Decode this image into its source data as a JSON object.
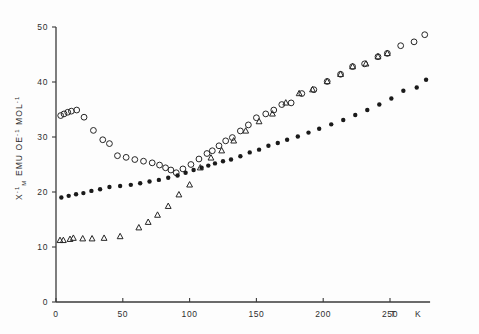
{
  "figure": {
    "background_color": "#fdfdfd",
    "ink_color": "#262626"
  },
  "chart_data": {
    "type": "scatter",
    "title": "",
    "subtitle": "",
    "xlabel": "T",
    "xunit": "K",
    "ylabel": "X-1 M  EMU  OE-1  MOL-1",
    "ylabel_parts": {
      "symbol": "X",
      "symbol_superscript": "-1",
      "symbol_subscript": "M",
      "unit1": "EMU",
      "unit2": "OE",
      "unit2_superscript": "-1",
      "unit3": "MOL",
      "unit3_superscript": "-1"
    },
    "xlim": [
      0,
      280
    ],
    "ylim": [
      0,
      50
    ],
    "xticks": [
      0,
      50,
      100,
      150,
      200,
      250
    ],
    "yticks": [
      0,
      10,
      20,
      30,
      40,
      50
    ],
    "xtick_labels": [
      "0",
      "50",
      "100",
      "150",
      "200",
      "250"
    ],
    "ytick_labels": [
      "0",
      "10",
      "20",
      "30",
      "40",
      "50"
    ],
    "grid": false,
    "legend": false,
    "legend_position": "none",
    "series": [
      {
        "name": "open-circles",
        "marker": "open-circle",
        "color": "#262626",
        "points": [
          [
            3.5,
            33.9
          ],
          [
            6.0,
            34.2
          ],
          [
            8.8,
            34.5
          ],
          [
            11.5,
            34.7
          ],
          [
            15.5,
            34.9
          ],
          [
            21.0,
            33.6
          ],
          [
            28.0,
            31.2
          ],
          [
            35.0,
            29.5
          ],
          [
            40.0,
            28.8
          ],
          [
            46.0,
            26.6
          ],
          [
            52.5,
            26.3
          ],
          [
            59.0,
            25.9
          ],
          [
            65.5,
            25.6
          ],
          [
            72.0,
            25.3
          ],
          [
            77.5,
            24.9
          ],
          [
            82.0,
            24.4
          ],
          [
            86.0,
            24.0
          ],
          [
            90.0,
            23.5
          ],
          [
            95.0,
            24.2
          ],
          [
            101.0,
            25.0
          ],
          [
            107.0,
            26.0
          ],
          [
            113.0,
            27.0
          ],
          [
            117.0,
            27.5
          ],
          [
            122.0,
            28.4
          ],
          [
            127.0,
            29.3
          ],
          [
            132.0,
            29.9
          ],
          [
            138.0,
            31.1
          ],
          [
            144.0,
            32.2
          ],
          [
            150.0,
            33.5
          ],
          [
            157.0,
            34.2
          ],
          [
            163.0,
            34.9
          ],
          [
            169.0,
            35.9
          ],
          [
            176.0,
            36.2
          ],
          [
            184.0,
            37.9
          ],
          [
            193.0,
            38.6
          ],
          [
            203.0,
            40.1
          ],
          [
            213.0,
            41.4
          ],
          [
            222.0,
            42.8
          ],
          [
            231.0,
            43.3
          ],
          [
            241.0,
            44.6
          ],
          [
            248.0,
            45.2
          ],
          [
            258.0,
            46.6
          ],
          [
            268.0,
            47.3
          ],
          [
            276.0,
            48.6
          ]
        ]
      },
      {
        "name": "filled-circles",
        "marker": "filled-circle",
        "color": "#1a1a1a",
        "points": [
          [
            4.0,
            19.0
          ],
          [
            9.5,
            19.3
          ],
          [
            15.0,
            19.6
          ],
          [
            20.5,
            19.8
          ],
          [
            26.5,
            20.2
          ],
          [
            33.0,
            20.5
          ],
          [
            40.0,
            20.9
          ],
          [
            48.0,
            21.1
          ],
          [
            56.0,
            21.3
          ],
          [
            63.0,
            21.6
          ],
          [
            70.0,
            21.9
          ],
          [
            77.0,
            22.2
          ],
          [
            84.0,
            22.6
          ],
          [
            91.0,
            23.0
          ],
          [
            97.0,
            23.5
          ],
          [
            103.0,
            24.0
          ],
          [
            109.0,
            24.4
          ],
          [
            114.0,
            24.8
          ],
          [
            119.0,
            25.2
          ],
          [
            125.0,
            25.6
          ],
          [
            131.0,
            25.9
          ],
          [
            138.0,
            26.5
          ],
          [
            145.0,
            27.2
          ],
          [
            152.0,
            27.7
          ],
          [
            159.0,
            28.4
          ],
          [
            166.0,
            28.9
          ],
          [
            173.0,
            29.5
          ],
          [
            181.0,
            30.1
          ],
          [
            189.0,
            30.8
          ],
          [
            197.0,
            31.5
          ],
          [
            206.0,
            32.3
          ],
          [
            215.0,
            33.1
          ],
          [
            224.0,
            34.0
          ],
          [
            233.0,
            34.9
          ],
          [
            242.0,
            35.9
          ],
          [
            251.0,
            37.0
          ],
          [
            260.0,
            38.4
          ],
          [
            270.0,
            39.0
          ],
          [
            277.0,
            40.4
          ]
        ]
      },
      {
        "name": "open-triangles",
        "marker": "open-triangle",
        "color": "#262626",
        "points": [
          [
            3.0,
            11.3
          ],
          [
            5.5,
            11.3
          ],
          [
            10.5,
            11.5
          ],
          [
            13.0,
            11.7
          ],
          [
            20.0,
            11.6
          ],
          [
            27.0,
            11.6
          ],
          [
            36.0,
            11.7
          ],
          [
            48.0,
            12.0
          ],
          [
            62.0,
            13.6
          ],
          [
            69.0,
            14.6
          ],
          [
            76.0,
            15.9
          ],
          [
            84.0,
            17.5
          ],
          [
            92.0,
            19.6
          ],
          [
            100.0,
            21.4
          ],
          [
            108.0,
            24.5
          ],
          [
            116.0,
            26.3
          ],
          [
            124.0,
            27.6
          ],
          [
            133.0,
            29.4
          ],
          [
            142.0,
            31.2
          ],
          [
            152.0,
            32.9
          ],
          [
            162.0,
            34.3
          ],
          [
            172.0,
            36.3
          ],
          [
            182.0,
            38.0
          ],
          [
            192.0,
            38.7
          ],
          [
            203.0,
            40.2
          ],
          [
            213.0,
            41.5
          ],
          [
            222.0,
            42.9
          ],
          [
            232.0,
            43.4
          ],
          [
            241.0,
            44.7
          ],
          [
            248.0,
            45.3
          ]
        ]
      }
    ]
  }
}
